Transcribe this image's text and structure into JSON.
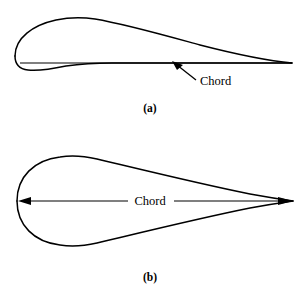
{
  "figure": {
    "background_color": "#ffffff",
    "stroke_color": "#000000",
    "panels": [
      {
        "id": "panel-a",
        "caption": "(a)",
        "caption_x": 150,
        "caption_y": 112,
        "shape_name": "cambered-airfoil",
        "chord_label": "Chord",
        "chord_label_x": 200,
        "chord_label_y": 85,
        "leading_edge_x": 15,
        "trailing_edge_x": 292,
        "chord_line_y": 63,
        "leader_from_x": 196,
        "leader_from_y": 80,
        "leader_to_x": 174,
        "leader_to_y": 63
      },
      {
        "id": "panel-b",
        "caption": "(b)",
        "caption_x": 150,
        "caption_y": 281,
        "shape_name": "symmetric-teardrop-airfoil",
        "chord_label": "Chord",
        "chord_label_x": 150,
        "chord_label_y": 205,
        "leading_edge_x": 17,
        "trailing_edge_x": 293,
        "chord_line_y": 201,
        "half_thickness": 45,
        "max_thickness_x": 85
      }
    ]
  }
}
